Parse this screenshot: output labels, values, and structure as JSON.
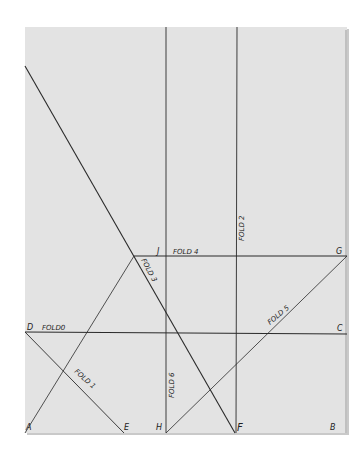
{
  "diagram": {
    "title": "",
    "paper": {
      "x": 25,
      "y": 27,
      "width": 322,
      "height": 406,
      "color": "#e3e3e3"
    },
    "points": {
      "A": {
        "label": "A",
        "x": 25,
        "y": 433
      },
      "B": {
        "label": "B",
        "x": 347,
        "y": 433
      },
      "C": {
        "label": "C",
        "x": 347,
        "y": 332
      },
      "D": {
        "label": "D",
        "x": 25,
        "y": 332
      },
      "E": {
        "label": "E",
        "x": 124,
        "y": 433
      },
      "F": {
        "label": "F",
        "x": 235,
        "y": 433
      },
      "G": {
        "label": "G",
        "x": 347,
        "y": 256
      },
      "H": {
        "label": "H",
        "x": 166,
        "y": 433
      },
      "J": {
        "label": "J",
        "x": 166,
        "y": 256
      }
    },
    "folds": [
      {
        "id": "fold0",
        "label": "FOLD 0",
        "from": "D",
        "to": "C"
      },
      {
        "id": "fold1",
        "label": "FOLD 1",
        "from": "D",
        "to": "E"
      },
      {
        "id": "fold2",
        "label": "FOLD 2",
        "from": "top",
        "to": "F",
        "x": 237
      },
      {
        "id": "fold3",
        "label": "FOLD 3",
        "from": "top-left",
        "to": "F"
      },
      {
        "id": "fold4",
        "label": "FOLD 4",
        "from": "J",
        "to": "G"
      },
      {
        "id": "fold5",
        "label": "FOLD 5",
        "from": "H",
        "to": "G"
      },
      {
        "id": "fold6",
        "label": "FOLD 6",
        "from": "top",
        "to": "H",
        "x": 166
      }
    ],
    "labels": {
      "fold0": "FOLD0",
      "fold1": "FOLD 1",
      "fold2": "FOLD 2",
      "fold3": "FOLD 3",
      "fold4": "FOLD 4",
      "fold5": "FOLD 5",
      "fold6": "FOLD 6",
      "A": "A",
      "B": "B",
      "C": "C",
      "D": "D",
      "E": "E",
      "F": "F",
      "G": "G",
      "H": "H",
      "J": "J"
    }
  }
}
